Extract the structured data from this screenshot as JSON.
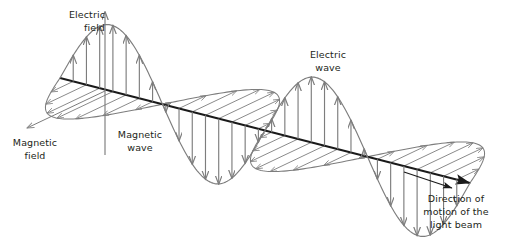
{
  "labels": {
    "electric_field": {
      "text": "Electric\nfield"
    },
    "magnetic_field": {
      "text": "Magnetic\nfield"
    },
    "magnetic_wave": {
      "text": "Magnetic\nwave"
    },
    "electric_wave": {
      "text": "Electric\nwave"
    },
    "direction": {
      "text": "Direction of\nmotion of the\nlight beam"
    }
  },
  "colors": {
    "background": "#ffffff",
    "axis": "#1a1a1a",
    "wave": "#7d7d7d",
    "arrow": "#7d7d7d",
    "text": "#231f20"
  },
  "chart_data": {
    "type": "line",
    "title": "",
    "xlabel": "",
    "ylabel": "",
    "propagation_axis": {
      "start": [
        60,
        78
      ],
      "end": [
        470,
        183
      ],
      "arrowhead": true
    },
    "electric_field_axis": {
      "origin": [
        105,
        91
      ],
      "tip": [
        105,
        12
      ],
      "arrowhead": true,
      "tail": [
        105,
        155
      ]
    },
    "magnetic_field_axis": {
      "origin": [
        105,
        91
      ],
      "tip": [
        27,
        128
      ],
      "arrowhead": true
    },
    "wave": {
      "cycles": 2,
      "samples": 260,
      "t_start": 0.0,
      "t_end": 2.0,
      "electric_amplitude_px": 66,
      "magnetic_amplitude_px": 62,
      "magnetic_dx_px": -40,
      "magnetic_dy_px": 19,
      "phase_offset_turns": 0.0
    },
    "electric_extrema": [
      {
        "kind": "crest",
        "x": 146,
        "y": 28
      },
      {
        "kind": "trough",
        "x": 245,
        "y": 190
      },
      {
        "kind": "crest",
        "x": 301,
        "y": 70
      },
      {
        "kind": "trough",
        "x": 375,
        "y": 232
      }
    ],
    "magnetic_extrema": [
      {
        "kind": "lobe-near",
        "x": 120,
        "y": 124
      },
      {
        "kind": "lobe-far",
        "x": 255,
        "y": 96
      },
      {
        "kind": "lobe-near",
        "x": 330,
        "y": 160
      },
      {
        "kind": "lobe-far",
        "x": 430,
        "y": 131
      }
    ],
    "electric_arrow_count": 30,
    "magnetic_arrow_count": 30,
    "grid": false,
    "legend": "none"
  }
}
